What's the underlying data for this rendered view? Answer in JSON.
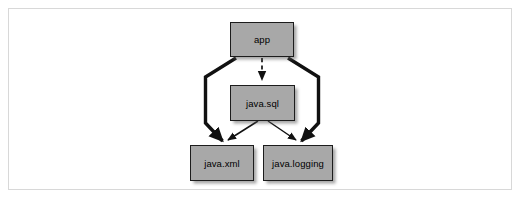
{
  "figure": {
    "background_color": "#ffffff",
    "frame_color": "#d8d8d8"
  },
  "diagram": {
    "type": "directed-graph",
    "node_fill": "#a8a8a8",
    "node_stroke": "#1c1c1c",
    "edge_color": "#111111",
    "nodes": [
      {
        "id": "app",
        "label": "app",
        "x": 230,
        "y": 22,
        "width": 64,
        "height": 35
      },
      {
        "id": "java.sql",
        "label": "java.sql",
        "x": 230,
        "y": 85,
        "width": 65,
        "height": 36
      },
      {
        "id": "java.xml",
        "label": "java.xml",
        "x": 190,
        "y": 145,
        "width": 64,
        "height": 36
      },
      {
        "id": "java.logging",
        "label": "java.logging",
        "x": 263,
        "y": 145,
        "width": 70,
        "height": 36
      }
    ],
    "edges": [
      {
        "from": "app",
        "to": "java.sql",
        "style": "dashed",
        "weight": "thin",
        "arrowhead": "solid"
      },
      {
        "from": "app",
        "to": "java.xml",
        "style": "solid",
        "weight": "thick",
        "arrowhead": "solid"
      },
      {
        "from": "app",
        "to": "java.logging",
        "style": "solid",
        "weight": "thick",
        "arrowhead": "solid"
      },
      {
        "from": "java.sql",
        "to": "java.xml",
        "style": "solid",
        "weight": "thin",
        "arrowhead": "solid"
      },
      {
        "from": "java.sql",
        "to": "java.logging",
        "style": "solid",
        "weight": "thin",
        "arrowhead": "solid"
      }
    ]
  }
}
